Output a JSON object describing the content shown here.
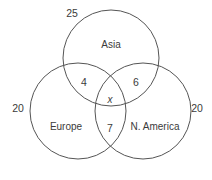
{
  "diagram": {
    "type": "venn-3-set",
    "title": "",
    "background_color": "#ffffff",
    "stroke_color": "#555555",
    "text_color": "#3b3b3b",
    "circles": [
      {
        "id": "asia",
        "label": "Asia",
        "cx": 111,
        "cy": 58,
        "r": 48,
        "label_x": 111,
        "label_y": 45
      },
      {
        "id": "europe",
        "label": "Europe",
        "cx": 78,
        "cy": 111,
        "r": 48,
        "label_x": 66,
        "label_y": 127
      },
      {
        "id": "namerica",
        "label": "N. America",
        "cx": 143,
        "cy": 111,
        "r": 48,
        "label_x": 155,
        "label_y": 127
      }
    ],
    "region_values": [
      {
        "id": "asia-only",
        "value": "25",
        "x": 72,
        "y": 13,
        "sets": [
          "Asia"
        ],
        "position": "outside-top-left"
      },
      {
        "id": "asia-europe",
        "value": "4",
        "x": 84,
        "y": 82,
        "sets": [
          "Asia",
          "Europe"
        ]
      },
      {
        "id": "asia-namerica",
        "value": "6",
        "x": 136,
        "y": 82,
        "sets": [
          "Asia",
          "N. America"
        ]
      },
      {
        "id": "all-three",
        "value": "x",
        "x": 110,
        "y": 100,
        "sets": [
          "Asia",
          "Europe",
          "N. America"
        ],
        "italic": true
      },
      {
        "id": "europe-namerica",
        "value": "7",
        "x": 110,
        "y": 128,
        "sets": [
          "Europe",
          "N. America"
        ]
      },
      {
        "id": "europe-outside",
        "value": "20",
        "x": 18,
        "y": 108,
        "sets": [
          "Europe"
        ],
        "position": "outside-left"
      },
      {
        "id": "namerica-outside",
        "value": "20",
        "x": 197,
        "y": 108,
        "sets": [
          "N. America"
        ],
        "position": "outside-right"
      }
    ]
  }
}
